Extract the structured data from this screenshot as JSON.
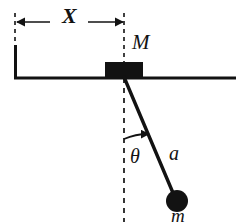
{
  "figure": {
    "background_color": "#ffffff",
    "ink_color": "#121212",
    "width": 245,
    "height": 224
  },
  "labels": {
    "distance_x": "X",
    "block_mass": "M",
    "angle": "θ",
    "rod_length": "a",
    "bob_mass": "m"
  },
  "icons": {
    "dimension_arrow_left": "arrow-left-icon",
    "dimension_arrow_right": "arrow-right-icon",
    "angle_arc_arrow": "arc-arrow-icon"
  },
  "geometry": {
    "surface_line": {
      "x1": 14,
      "y1": 78,
      "x2": 236,
      "y2": 78,
      "stroke_width": 3
    },
    "left_wall": {
      "x1": 15,
      "y1": 45,
      "x2": 15,
      "y2": 78,
      "stroke_width": 3
    },
    "block": {
      "x": 105,
      "y": 62,
      "width": 38,
      "height": 15,
      "fill": "#121212"
    },
    "dimension_line": {
      "y": 22,
      "x_start": 16,
      "x_end": 124
    },
    "extension_tick_left": {
      "x": 15,
      "y1": 13,
      "y2": 44,
      "dashed": true
    },
    "extension_tick_right": {
      "x": 124,
      "y1": 13,
      "y2": 62,
      "dashed": true
    },
    "vertical_dashed": {
      "x": 124,
      "y1": 78,
      "y2": 222,
      "dashed": true
    },
    "rod": {
      "x1": 124,
      "y1": 77,
      "x2": 176,
      "y2": 200,
      "stroke_width": 3.4
    },
    "bob": {
      "cx": 177,
      "cy": 201,
      "r": 11,
      "fill": "#121212"
    },
    "angle_arc": {
      "center_x": 124,
      "center_y": 77,
      "radius": 62,
      "start_deg": 90,
      "end_deg": 67
    }
  }
}
